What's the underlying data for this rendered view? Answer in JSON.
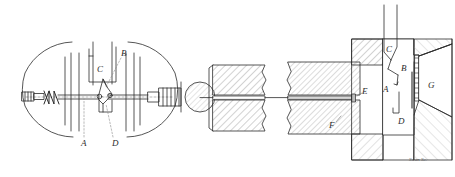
{
  "figure": {
    "style": "antique line engraving, black ink on white",
    "ink_color": "#2b2b2b",
    "background_color": "#ffffff",
    "signature": "Swan Sc."
  },
  "left_assembly": {
    "name": "circular spring-and-pawl mechanism",
    "labels": [
      {
        "id": "A",
        "text": "A",
        "x": 84,
        "y": 143
      },
      {
        "id": "B",
        "text": "B",
        "x": 124,
        "y": 53
      },
      {
        "id": "C",
        "text": "C",
        "x": 99,
        "y": 69
      },
      {
        "id": "D",
        "text": "D",
        "x": 115,
        "y": 143
      }
    ]
  },
  "right_assembly": {
    "name": "sectional view of hatched blocks and linkage",
    "labels": [
      {
        "id": "A",
        "text": "A",
        "x": 385,
        "y": 89
      },
      {
        "id": "B",
        "text": "B",
        "x": 402,
        "y": 68
      },
      {
        "id": "C",
        "text": "C",
        "x": 387,
        "y": 49
      },
      {
        "id": "D",
        "text": "D",
        "x": 400,
        "y": 121
      },
      {
        "id": "E",
        "text": "E",
        "x": 364,
        "y": 91
      },
      {
        "id": "F",
        "text": "F",
        "x": 331,
        "y": 125
      },
      {
        "id": "G",
        "text": "G",
        "x": 430,
        "y": 85
      }
    ]
  }
}
